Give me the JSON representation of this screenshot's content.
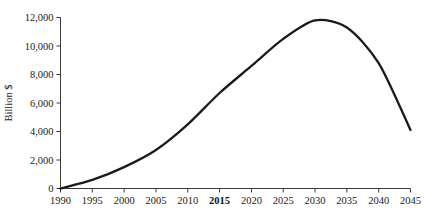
{
  "chart_data": {
    "type": "line",
    "title": "",
    "subtitle": "",
    "xlabel": "",
    "ylabel": "Billion $",
    "x": [
      1990,
      1995,
      2000,
      2005,
      2010,
      2015,
      2020,
      2025,
      2030,
      2035,
      2040,
      2045
    ],
    "values": [
      0,
      600,
      1500,
      2700,
      4500,
      6700,
      8600,
      10500,
      11800,
      11300,
      8800,
      4100
    ],
    "series": [
      {
        "name": "Billion $",
        "values": [
          0,
          600,
          1500,
          2700,
          4500,
          6700,
          8600,
          10500,
          11800,
          11300,
          8800,
          4100
        ]
      }
    ],
    "xlim": [
      1990,
      2045
    ],
    "ylim": [
      0,
      12000
    ],
    "xticks": [
      1990,
      1995,
      2000,
      2005,
      2010,
      2015,
      2020,
      2025,
      2030,
      2035,
      2040,
      2045
    ],
    "xtick_labels": [
      "1990",
      "1995",
      "2000",
      "2005",
      "2010",
      "2015",
      "2020",
      "2025",
      "2030",
      "2035",
      "2040",
      "2045"
    ],
    "bold_xtick_labels": [
      "2015"
    ],
    "yticks": [
      0,
      2000,
      4000,
      6000,
      8000,
      10000,
      12000
    ],
    "ytick_labels": [
      "0",
      "2,000",
      "4,000",
      "6,000",
      "8,000",
      "10,000",
      "12,000"
    ],
    "grid": false,
    "legend": null,
    "legend_position": "none",
    "line_color": "#1b1b1b",
    "axis_color": "#3a3a3a",
    "background_color": "#ffffff",
    "annotations": []
  }
}
